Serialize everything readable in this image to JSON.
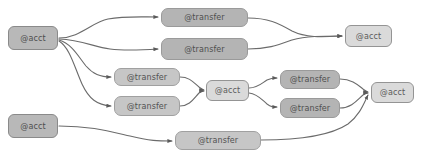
{
  "diagram": {
    "background_color": "#ffffff",
    "edge_color": "#6b6b6b",
    "node_fill_dark": "#b8b8b8",
    "node_fill_light": "#dadada",
    "node_border_color": "#8d8d8d",
    "text_color": "#555555",
    "nodes": [
      {
        "id": "acct-1",
        "label": "@acct",
        "kind": "acct",
        "style": "acct-dark",
        "x": 8,
        "y": 26,
        "w": 50,
        "h": 24
      },
      {
        "id": "transfer-1",
        "label": "@transfer",
        "kind": "transfer",
        "style": "transfer",
        "x": 161,
        "y": 8,
        "w": 87,
        "h": 19
      },
      {
        "id": "transfer-2",
        "label": "@transfer",
        "kind": "transfer",
        "style": "transfer",
        "x": 161,
        "y": 38,
        "w": 87,
        "h": 22
      },
      {
        "id": "acct-2",
        "label": "@acct",
        "kind": "acct",
        "style": "acct-light",
        "x": 345,
        "y": 25,
        "w": 47,
        "h": 22
      },
      {
        "id": "transfer-3",
        "label": "@transfer",
        "kind": "transfer",
        "style": "transfer-light",
        "x": 114,
        "y": 68,
        "w": 66,
        "h": 18
      },
      {
        "id": "transfer-4",
        "label": "@transfer",
        "kind": "transfer",
        "style": "transfer-light",
        "x": 114,
        "y": 96,
        "w": 66,
        "h": 20
      },
      {
        "id": "acct-3",
        "label": "@acct",
        "kind": "acct",
        "style": "acct-light",
        "x": 206,
        "y": 80,
        "w": 43,
        "h": 21
      },
      {
        "id": "transfer-5",
        "label": "@transfer",
        "kind": "transfer",
        "style": "transfer",
        "x": 280,
        "y": 70,
        "w": 60,
        "h": 19
      },
      {
        "id": "transfer-6",
        "label": "@transfer",
        "kind": "transfer",
        "style": "transfer",
        "x": 280,
        "y": 98,
        "w": 60,
        "h": 20
      },
      {
        "id": "acct-4",
        "label": "@acct",
        "kind": "acct",
        "style": "acct-light",
        "x": 371,
        "y": 82,
        "w": 43,
        "h": 21
      },
      {
        "id": "acct-5",
        "label": "@acct",
        "kind": "acct",
        "style": "acct-dark",
        "x": 8,
        "y": 114,
        "w": 50,
        "h": 24
      },
      {
        "id": "transfer-7",
        "label": "@transfer",
        "kind": "transfer",
        "style": "transfer-light",
        "x": 175,
        "y": 131,
        "w": 86,
        "h": 19
      }
    ],
    "edges": [
      {
        "from": "acct-1",
        "to": "transfer-1",
        "path": "M 59,38 C 80,38 92,22 108,19 C 124,16 140,17 158,17"
      },
      {
        "from": "acct-1",
        "to": "transfer-2",
        "path": "M 59,39 C 82,40 94,47 110,49 C 126,51 142,50 158,49"
      },
      {
        "from": "acct-1",
        "to": "transfer-3",
        "path": "M 59,40 C 72,44 78,56 86,66 C 93,74 100,77 111,77"
      },
      {
        "from": "acct-1",
        "to": "transfer-4",
        "path": "M 59,41 C 70,48 74,66 82,84 C 89,99 97,105 111,106"
      },
      {
        "from": "transfer-1",
        "to": "acct-2",
        "path": "M 248,18 C 268,18 278,23 292,31 C 306,38 322,37 342,36"
      },
      {
        "from": "transfer-2",
        "to": "acct-2",
        "path": "M 248,49 C 268,49 278,45 292,40 C 306,36 322,36 342,36"
      },
      {
        "from": "transfer-3",
        "to": "acct-3",
        "path": "M 180,77 C 190,77 194,83 199,87 C 202,89 203,90 204,90"
      },
      {
        "from": "transfer-4",
        "to": "acct-3",
        "path": "M 180,106 C 190,106 194,98 199,93 C 202,91 203,91 204,91"
      },
      {
        "from": "acct-3",
        "to": "transfer-5",
        "path": "M 249,88 C 258,88 262,83 267,80 C 271,78 273,78 277,78"
      },
      {
        "from": "acct-3",
        "to": "transfer-6",
        "path": "M 249,93 C 258,94 262,100 267,104 C 271,107 273,107 277,107"
      },
      {
        "from": "transfer-5",
        "to": "acct-4",
        "path": "M 340,79 C 352,79 358,85 363,89 C 366,91 367,92 368,92"
      },
      {
        "from": "transfer-6",
        "to": "acct-4",
        "path": "M 340,108 C 352,108 358,99 363,95 C 366,93 367,93 368,93"
      },
      {
        "from": "acct-5",
        "to": "transfer-7",
        "path": "M 59,126 C 90,126 108,131 130,136 C 150,141 158,141 172,141"
      },
      {
        "from": "transfer-7",
        "to": "acct-4",
        "path": "M 261,140 C 300,140 330,136 348,124 C 360,115 364,103 368,95"
      }
    ]
  }
}
